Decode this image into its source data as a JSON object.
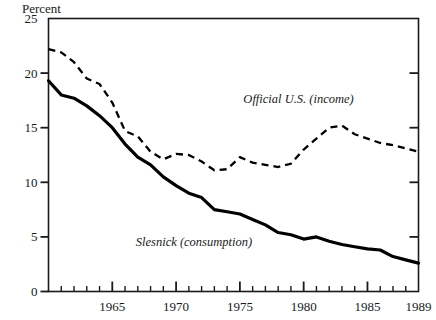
{
  "chart_data": {
    "type": "line",
    "title": "",
    "xlabel": "",
    "ylabel": "Percent",
    "ylim": [
      0,
      25
    ],
    "xlim": [
      1960,
      1989
    ],
    "yticks": [
      0,
      5,
      10,
      15,
      20,
      25
    ],
    "ytick_labels": [
      "0",
      "5",
      "10",
      "15",
      "20",
      "25"
    ],
    "xticks": [
      1965,
      1970,
      1975,
      1980,
      1985,
      1989
    ],
    "xtick_labels": [
      "1965",
      "1970",
      "1975",
      "1980",
      "1985",
      "1989"
    ],
    "minor_xticks_every": 1,
    "grid": false,
    "legend_position": "inline-annotation",
    "x": [
      1960,
      1961,
      1962,
      1963,
      1964,
      1965,
      1966,
      1967,
      1968,
      1969,
      1970,
      1971,
      1972,
      1973,
      1974,
      1975,
      1976,
      1977,
      1978,
      1979,
      1980,
      1981,
      1982,
      1983,
      1984,
      1985,
      1986,
      1987,
      1988,
      1989
    ],
    "series": [
      {
        "name": "Official U.S. (income)",
        "style": "dashed",
        "color": "#000000",
        "values": [
          22.2,
          21.9,
          21.0,
          19.5,
          19.0,
          17.3,
          14.7,
          14.2,
          12.8,
          12.1,
          12.6,
          12.5,
          11.9,
          11.1,
          11.2,
          12.3,
          11.8,
          11.6,
          11.4,
          11.7,
          13.0,
          14.0,
          15.0,
          15.2,
          14.4,
          14.0,
          13.6,
          13.4,
          13.1,
          12.8
        ]
      },
      {
        "name": "Slesnick (consumption)",
        "style": "solid",
        "color": "#000000",
        "values": [
          19.3,
          18.0,
          17.7,
          17.0,
          16.1,
          15.0,
          13.5,
          12.3,
          11.6,
          10.5,
          9.7,
          9.0,
          8.6,
          7.5,
          7.3,
          7.1,
          6.6,
          6.1,
          5.4,
          5.2,
          4.8,
          5.0,
          4.6,
          4.3,
          4.1,
          3.9,
          3.8,
          3.2,
          2.9,
          2.6
        ]
      }
    ],
    "annotations": [
      {
        "text": "Official U.S. (income)",
        "x": 1979.6,
        "y": 17.3,
        "anchor": "middle"
      },
      {
        "text": "Slesnick (consumption)",
        "x": 1971.4,
        "y": 4.2,
        "anchor": "middle"
      }
    ]
  }
}
